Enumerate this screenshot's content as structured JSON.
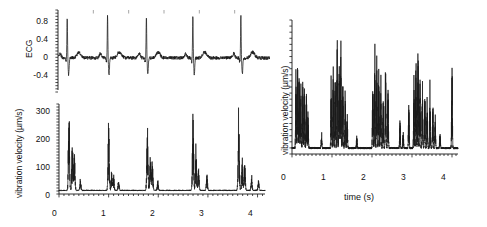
{
  "figure": {
    "background": "#ffffff",
    "trace_color": "#1a1a1a",
    "axis_color": "#1a1a1a"
  },
  "panels": {
    "ecg": {
      "name": "ECG trace panel",
      "ylabel": "ECG",
      "yticks": [
        "0.8",
        "0.4",
        "0",
        "-0.4"
      ],
      "xticks": [],
      "xtitle": ""
    },
    "vibration_left": {
      "name": "Vibration velocity vs time (left)",
      "ylabel": "vibration velocity (µm/s)",
      "yticks": [
        "300",
        "200",
        "100",
        "0"
      ],
      "xticks": [
        "0",
        "1",
        "2",
        "3",
        "4"
      ],
      "xtitle": ""
    },
    "vibration_right": {
      "name": "Vibration velocity vs time (right)",
      "ylabel": "vibration velocity (µm/s)",
      "yticks": [
        "0"
      ],
      "xticks": [
        "0",
        "1",
        "2",
        "3",
        "4"
      ],
      "xtitle": "time (s)"
    }
  },
  "chart_data": [
    {
      "type": "line",
      "id": "ecg",
      "title": "",
      "xlabel": "",
      "ylabel": "ECG",
      "xlim": [
        0,
        4.15
      ],
      "ylim": [
        -0.55,
        0.95
      ],
      "yticks": [
        -0.4,
        0,
        0.4,
        0.8
      ],
      "ytick_labels": [
        "-0.4",
        "0",
        "0.4",
        "0.8"
      ],
      "xticks": [],
      "grid": false,
      "legend": null,
      "description": "Electrocardiogram with five QRS complexes (R-peaks) over ~4 s, baseline near 0 with small P and T waves and low-amplitude noise.",
      "r_peak_times": [
        0.18,
        0.97,
        1.73,
        2.64,
        3.58
      ],
      "r_peak_amplitude": 0.85,
      "s_trough_amplitude": -0.33,
      "baseline": 0.02,
      "noise_amplitude": 0.07
    },
    {
      "type": "line",
      "id": "vibration_left",
      "title": "",
      "xlabel": "",
      "ylabel": "vibration velocity (µm/s)",
      "xlim": [
        0,
        4.15
      ],
      "ylim": [
        -12,
        345
      ],
      "yticks": [
        0,
        100,
        200,
        300
      ],
      "ytick_labels": [
        "0",
        "100",
        "200",
        "300"
      ],
      "xticks": [
        0,
        1,
        2,
        3,
        4
      ],
      "xtick_labels": [
        "0",
        "1",
        "2",
        "3",
        "4"
      ],
      "grid": false,
      "legend": null,
      "description": "Heart-synchronous vibration bursts: each cardiac cycle shows one tall primary spike (~270-330 um/s) followed by smaller secondary and tertiary peaks decaying toward baseline.",
      "bursts": [
        {
          "time": 0.2,
          "peak": 330
        },
        {
          "time": 0.27,
          "peak": 195
        },
        {
          "time": 0.31,
          "peak": 150
        },
        {
          "time": 0.43,
          "peak": 42
        },
        {
          "time": 1.0,
          "peak": 268
        },
        {
          "time": 1.06,
          "peak": 75
        },
        {
          "time": 1.1,
          "peak": 62
        },
        {
          "time": 1.2,
          "peak": 40
        },
        {
          "time": 1.78,
          "peak": 272
        },
        {
          "time": 1.84,
          "peak": 150
        },
        {
          "time": 1.88,
          "peak": 120
        },
        {
          "time": 1.99,
          "peak": 38
        },
        {
          "time": 2.7,
          "peak": 315
        },
        {
          "time": 2.76,
          "peak": 175
        },
        {
          "time": 2.81,
          "peak": 95
        },
        {
          "time": 2.98,
          "peak": 70
        },
        {
          "time": 3.62,
          "peak": 300
        },
        {
          "time": 3.69,
          "peak": 140
        },
        {
          "time": 3.74,
          "peak": 120
        },
        {
          "time": 3.88,
          "peak": 55
        },
        {
          "time": 4.02,
          "peak": 45
        }
      ]
    },
    {
      "type": "line",
      "id": "vibration_right",
      "title": "",
      "xlabel": "time (s)",
      "ylabel": "vibration velocity (µm/s)",
      "xlim": [
        0,
        4.15
      ],
      "ylim": [
        -0.04,
        1.05
      ],
      "yticks": [
        0
      ],
      "ytick_labels": [
        "0"
      ],
      "xticks": [
        0,
        1,
        2,
        3,
        4
      ],
      "xtick_labels": [
        "0",
        "1",
        "2",
        "3",
        "4"
      ],
      "grid": false,
      "legend": null,
      "y_axis_unlabeled_ticks": 22,
      "description": "Vibration velocity for a second subject: dense clusters of tall narrow multi-peaks grouped per cardiac cycle around 0.1-0.4 s, 1.0-1.4 s, 2.0-2.4 s, 3.0-3.6 s and a single spike near 4.0 s, with low-level activity between clusters.",
      "bursts": [
        {
          "time": 0.1,
          "peak": 0.62
        },
        {
          "time": 0.14,
          "peak": 0.72
        },
        {
          "time": 0.18,
          "peak": 0.66
        },
        {
          "time": 0.22,
          "peak": 0.52
        },
        {
          "time": 0.27,
          "peak": 0.58
        },
        {
          "time": 0.31,
          "peak": 0.5
        },
        {
          "time": 0.36,
          "peak": 0.44
        },
        {
          "time": 0.4,
          "peak": 0.3
        },
        {
          "time": 0.74,
          "peak": 0.12
        },
        {
          "time": 0.98,
          "peak": 0.55
        },
        {
          "time": 1.03,
          "peak": 0.62
        },
        {
          "time": 1.08,
          "peak": 0.72
        },
        {
          "time": 1.13,
          "peak": 0.95
        },
        {
          "time": 1.18,
          "peak": 0.88
        },
        {
          "time": 1.22,
          "peak": 0.9
        },
        {
          "time": 1.27,
          "peak": 0.6
        },
        {
          "time": 1.33,
          "peak": 0.42
        },
        {
          "time": 1.38,
          "peak": 0.3
        },
        {
          "time": 1.62,
          "peak": 0.1
        },
        {
          "time": 2.02,
          "peak": 0.6
        },
        {
          "time": 2.07,
          "peak": 0.78
        },
        {
          "time": 2.12,
          "peak": 0.85
        },
        {
          "time": 2.17,
          "peak": 0.7
        },
        {
          "time": 2.22,
          "peak": 0.56
        },
        {
          "time": 2.28,
          "peak": 0.4
        },
        {
          "time": 2.34,
          "peak": 0.76
        },
        {
          "time": 2.4,
          "peak": 0.52
        },
        {
          "time": 2.7,
          "peak": 0.22
        },
        {
          "time": 2.78,
          "peak": 0.14
        },
        {
          "time": 2.92,
          "peak": 0.36
        },
        {
          "time": 3.05,
          "peak": 0.58
        },
        {
          "time": 3.1,
          "peak": 0.74
        },
        {
          "time": 3.15,
          "peak": 0.92
        },
        {
          "time": 3.2,
          "peak": 0.7
        },
        {
          "time": 3.26,
          "peak": 0.54
        },
        {
          "time": 3.32,
          "peak": 0.46
        },
        {
          "time": 3.38,
          "peak": 0.4
        },
        {
          "time": 3.45,
          "peak": 0.5
        },
        {
          "time": 3.52,
          "peak": 0.44
        },
        {
          "time": 3.58,
          "peak": 0.26
        },
        {
          "time": 3.7,
          "peak": 0.14
        },
        {
          "time": 4.0,
          "peak": 0.7
        }
      ]
    }
  ]
}
